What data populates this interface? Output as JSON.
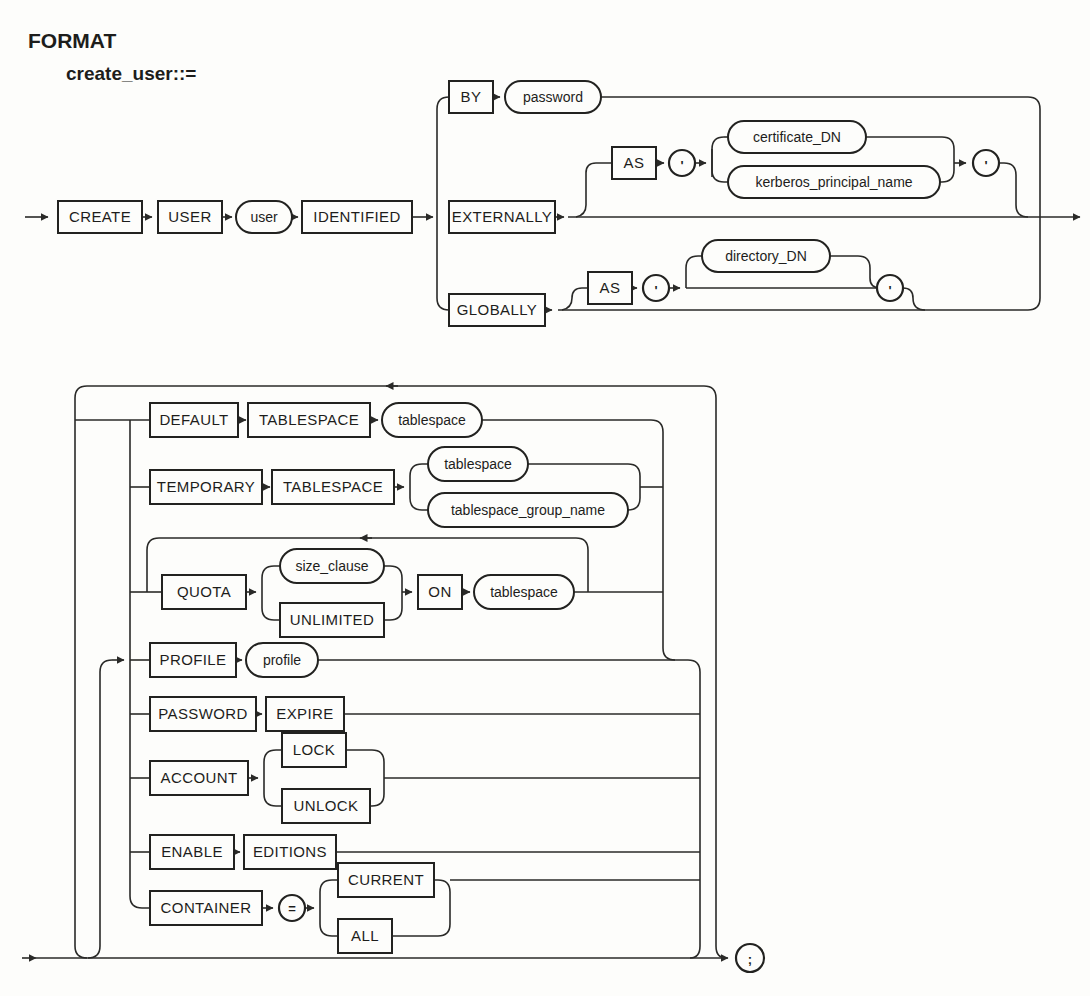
{
  "colors": {
    "ink": "#222220",
    "paper": "#fdfdfb"
  },
  "header": {
    "format_label": "FORMAT",
    "rule_name": "create_user::="
  },
  "d1": {
    "create": "CREATE",
    "user_kw": "USER",
    "user": "user",
    "identified": "IDENTIFIED",
    "by": "BY",
    "password": "password",
    "externally": "EXTERNALLY",
    "as_ext": "AS",
    "quote_open_ext": "'",
    "certificate_dn": "certificate_DN",
    "kerberos_principal_name": "kerberos_principal_name",
    "quote_close_ext": "'",
    "globally": "GLOBALLY",
    "as_glob": "AS",
    "quote_open_glob": "'",
    "directory_dn": "directory_DN",
    "quote_close_glob": "'"
  },
  "d2": {
    "default_kw": "DEFAULT",
    "tablespace_kw1": "TABLESPACE",
    "tablespace1": "tablespace",
    "temporary": "TEMPORARY",
    "tablespace_kw2": "TABLESPACE",
    "tablespace2": "tablespace",
    "tablespace_group_name": "tablespace_group_name",
    "quota": "QUOTA",
    "size_clause": "size_clause",
    "unlimited": "UNLIMITED",
    "on_kw": "ON",
    "tablespace3": "tablespace",
    "profile_kw": "PROFILE",
    "profile": "profile",
    "password_kw": "PASSWORD",
    "expire": "EXPIRE",
    "account": "ACCOUNT",
    "lock_kw": "LOCK",
    "unlock_kw": "UNLOCK",
    "enable": "ENABLE",
    "editions": "EDITIONS",
    "container": "CONTAINER",
    "equals": "=",
    "current": "CURRENT",
    "all_kw": "ALL",
    "semicolon": ";"
  }
}
